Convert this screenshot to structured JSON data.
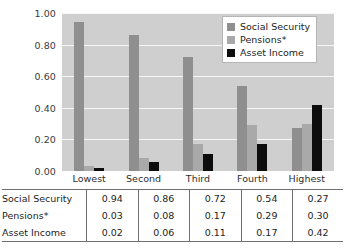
{
  "chart_data": {
    "type": "bar",
    "title": "",
    "xlabel": "",
    "ylabel": "",
    "ylim": [
      0.0,
      1.0
    ],
    "ytick_labels": [
      "1.00",
      "0.80",
      "0.60",
      "0.40",
      "0.20",
      "0.00"
    ],
    "ytick_values": [
      1.0,
      0.8,
      0.6,
      0.4,
      0.2,
      0.0
    ],
    "grid": true,
    "legend_position": "top-right",
    "categories": [
      "Lowest",
      "Second",
      "Third",
      "Fourth",
      "Highest"
    ],
    "series": [
      {
        "name": "Social Security",
        "color": "#8f8f8f",
        "values": [
          0.94,
          0.86,
          0.72,
          0.54,
          0.27
        ]
      },
      {
        "name": "Pensions*",
        "color": "#a9a9a9",
        "values": [
          0.03,
          0.08,
          0.17,
          0.29,
          0.3
        ]
      },
      {
        "name": "Asset Income",
        "color": "#0d0d0d",
        "values": [
          0.02,
          0.06,
          0.11,
          0.17,
          0.42
        ]
      }
    ]
  },
  "legend": {
    "items": [
      {
        "label": "Social Security",
        "color": "#8f8f8f"
      },
      {
        "label": "Pensions*",
        "color": "#a9a9a9"
      },
      {
        "label": "Asset Income",
        "color": "#0d0d0d"
      }
    ]
  },
  "table": {
    "rows": [
      {
        "label": "Social Security",
        "cells": [
          "0.94",
          "0.86",
          "0.72",
          "0.54",
          "0.27"
        ]
      },
      {
        "label": "Pensions*",
        "cells": [
          "0.03",
          "0.08",
          "0.17",
          "0.29",
          "0.30"
        ]
      },
      {
        "label": "Asset Income",
        "cells": [
          "0.02",
          "0.06",
          "0.11",
          "0.17",
          "0.42"
        ]
      }
    ]
  },
  "colors": {
    "plot_background": "#cfcfcf",
    "gridline": "#f6f6f6",
    "table_border": "#6f6f6f",
    "page_background": "#ffffff"
  }
}
